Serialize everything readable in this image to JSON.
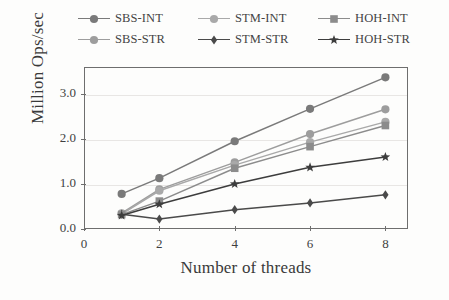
{
  "chart_data": {
    "type": "line",
    "title": "",
    "xlabel": "Number of threads",
    "ylabel": "Million Ops/sec",
    "x": [
      1,
      2,
      4,
      6,
      8
    ],
    "xlim": [
      0,
      8.6
    ],
    "ylim": [
      0.0,
      3.6
    ],
    "xticks": [
      "0",
      "2",
      "4",
      "6",
      "8"
    ],
    "xtick_values": [
      0,
      2,
      4,
      6,
      8
    ],
    "yticks": [
      "0.0",
      "1.0",
      "2.0",
      "3.0"
    ],
    "ytick_values": [
      0.0,
      1.0,
      2.0,
      3.0
    ],
    "grid": true,
    "grid_axis": "y",
    "legend_position": "above-plot",
    "legend_columns": 3,
    "series": [
      {
        "name": "SBS-INT",
        "marker": "circle",
        "color": "#7a7a7a",
        "values": [
          0.78,
          1.13,
          1.95,
          2.67,
          3.37
        ]
      },
      {
        "name": "SBS-STR",
        "marker": "circle",
        "color": "#9d9d9d",
        "values": [
          0.35,
          0.88,
          1.48,
          2.11,
          2.66
        ]
      },
      {
        "name": "STM-INT",
        "marker": "circle",
        "color": "#a9a9a9",
        "values": [
          0.33,
          0.85,
          1.42,
          1.93,
          2.38
        ]
      },
      {
        "name": "STM-STR",
        "marker": "diamond",
        "color": "#4a4a4a",
        "values": [
          0.33,
          0.22,
          0.43,
          0.58,
          0.76
        ]
      },
      {
        "name": "HOH-INT",
        "marker": "square",
        "color": "#8c8c8c",
        "values": [
          0.32,
          0.62,
          1.35,
          1.83,
          2.3
        ]
      },
      {
        "name": "HOH-STR",
        "marker": "star",
        "color": "#3d3d3d",
        "values": [
          0.3,
          0.55,
          1.0,
          1.37,
          1.6
        ]
      }
    ]
  },
  "legend": {
    "entries": [
      {
        "label": "SBS-INT"
      },
      {
        "label": "STM-INT"
      },
      {
        "label": "HOH-INT"
      },
      {
        "label": "SBS-STR"
      },
      {
        "label": "STM-STR"
      },
      {
        "label": "HOH-STR"
      }
    ]
  },
  "axes": {
    "y_title": "Million Ops/sec",
    "x_title": "Number of threads",
    "y_tick_labels": [
      "0.0",
      "1.0",
      "2.0",
      "3.0"
    ],
    "x_tick_labels": [
      "0",
      "2",
      "4",
      "6",
      "8"
    ]
  },
  "style": {
    "axis_color": "#6e6e6e",
    "grid_color": "#e8e6e4",
    "text_color": "#3a3a3a",
    "background": "#fdfdfc"
  }
}
